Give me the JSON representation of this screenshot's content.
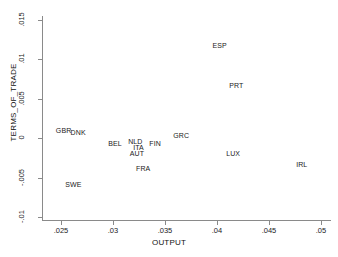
{
  "chart_data": {
    "type": "scatter",
    "title": "",
    "xlabel": "OUTPUT",
    "ylabel": "TERMS_OF_TRADE",
    "xlim": [
      0.0235,
      0.0507
    ],
    "ylim": [
      -0.0105,
      0.0158
    ],
    "xticks": [
      0.025,
      0.03,
      0.035,
      0.04,
      0.045,
      0.05
    ],
    "xtick_labels": [
      ".025",
      ".03",
      ".035",
      ".04",
      ".045",
      ".05"
    ],
    "yticks": [
      0.015,
      0.01,
      0.005,
      0,
      -0.005,
      -0.01
    ],
    "ytick_labels": [
      ".015",
      ".01",
      ".005",
      "0",
      "-.005",
      "-.01"
    ],
    "grid": false,
    "legend": null,
    "marker_style": "text-label-only",
    "points": [
      {
        "label": "GBR",
        "x": 0.02525,
        "y": 0.00105
      },
      {
        "label": "DNK",
        "x": 0.02665,
        "y": 0.0008
      },
      {
        "label": "SWE",
        "x": 0.0262,
        "y": -0.0058
      },
      {
        "label": "BEL",
        "x": 0.0302,
        "y": -0.00065
      },
      {
        "label": "NLD",
        "x": 0.03215,
        "y": -0.0004
      },
      {
        "label": "ITA",
        "x": 0.03245,
        "y": -0.00115
      },
      {
        "label": "AUT",
        "x": 0.0323,
        "y": -0.0019
      },
      {
        "label": "FIN",
        "x": 0.03405,
        "y": -0.00065
      },
      {
        "label": "FRA",
        "x": 0.0329,
        "y": -0.00375
      },
      {
        "label": "GRC",
        "x": 0.03655,
        "y": 0.0004
      },
      {
        "label": "LUX",
        "x": 0.04155,
        "y": -0.0019
      },
      {
        "label": "ESP",
        "x": 0.04025,
        "y": 0.01185
      },
      {
        "label": "PRT",
        "x": 0.04185,
        "y": 0.0068
      },
      {
        "label": "IRL",
        "x": 0.04815,
        "y": -0.00325
      }
    ]
  },
  "axes": {
    "x_title": "OUTPUT",
    "y_title": "TERMS_OF_TRADE"
  }
}
